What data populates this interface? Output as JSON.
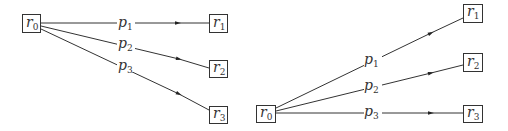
{
  "diagrams": [
    {
      "name": "left",
      "source": {
        "id": "r0",
        "base": "r",
        "sub": "0"
      },
      "targets": [
        {
          "id": "r1",
          "base": "r",
          "sub": "1"
        },
        {
          "id": "r2",
          "base": "r",
          "sub": "2"
        },
        {
          "id": "r3",
          "base": "r",
          "sub": "3"
        }
      ],
      "edges": [
        {
          "from": "r0",
          "to": "r1",
          "base": "p",
          "sub": "1"
        },
        {
          "from": "r0",
          "to": "r2",
          "base": "p",
          "sub": "2"
        },
        {
          "from": "r0",
          "to": "r3",
          "base": "p",
          "sub": "3"
        }
      ]
    },
    {
      "name": "right",
      "source": {
        "id": "r0",
        "base": "r",
        "sub": "0"
      },
      "targets": [
        {
          "id": "r1",
          "base": "r",
          "sub": "1"
        },
        {
          "id": "r2",
          "base": "r",
          "sub": "2"
        },
        {
          "id": "r3",
          "base": "r",
          "sub": "3"
        }
      ],
      "edges": [
        {
          "from": "r0",
          "to": "r1",
          "base": "p",
          "sub": "1"
        },
        {
          "from": "r0",
          "to": "r2",
          "base": "p",
          "sub": "2"
        },
        {
          "from": "r0",
          "to": "r3",
          "base": "p",
          "sub": "3"
        }
      ]
    }
  ]
}
